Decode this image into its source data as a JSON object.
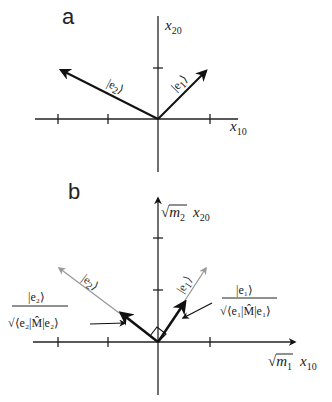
{
  "figure": {
    "panels": [
      {
        "id": "a",
        "label": "a",
        "y_axis_label": "x",
        "y_axis_sub": "20",
        "x_axis_label": "x",
        "x_axis_sub": "10",
        "vectors": [
          {
            "name": "e1",
            "ket": "|e",
            "ket_sub": "1",
            "ket_close": "⟩"
          },
          {
            "name": "e2",
            "ket": "|e",
            "ket_sub": "2",
            "ket_close": "⟩"
          }
        ]
      },
      {
        "id": "b",
        "label": "b",
        "y_axis_sqrt": "√",
        "y_axis_mass": "m",
        "y_axis_mass_sub": "2",
        "y_axis_label": "x",
        "y_axis_sub": "20",
        "x_axis_sqrt": "√",
        "x_axis_mass": "m",
        "x_axis_mass_sub": "1",
        "x_axis_label": "x",
        "x_axis_sub": "10",
        "vectors": [
          {
            "name": "e1",
            "ket": "|e",
            "ket_sub": "1",
            "ket_close": "⟩"
          },
          {
            "name": "e2",
            "ket": "|e",
            "ket_sub": "2",
            "ket_close": "⟩"
          }
        ],
        "normalized_e1": {
          "numerator": "|e₁⟩",
          "denominator": "√⟨e₁|M̂|e₁⟩"
        },
        "normalized_e2": {
          "numerator": "|e₂⟩",
          "denominator": "√⟨e₂|M̂|e₂⟩"
        }
      }
    ]
  }
}
